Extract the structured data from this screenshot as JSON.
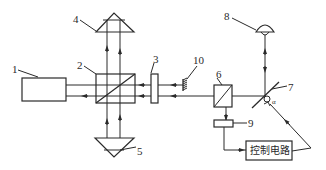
{
  "diagram": {
    "type": "optical-interferometer-schematic",
    "components": [
      {
        "id": "1",
        "label": "1",
        "shape": "rectangle"
      },
      {
        "id": "2",
        "label": "2",
        "shape": "beam-splitter-cube"
      },
      {
        "id": "3",
        "label": "3",
        "shape": "plate"
      },
      {
        "id": "4",
        "label": "4",
        "shape": "prism-top"
      },
      {
        "id": "5",
        "label": "5",
        "shape": "prism-bottom"
      },
      {
        "id": "6",
        "label": "6",
        "shape": "beam-splitter-cube"
      },
      {
        "id": "7",
        "label": "7",
        "shape": "tilted-mirror"
      },
      {
        "id": "8",
        "label": "8",
        "shape": "lamp-dome"
      },
      {
        "id": "9",
        "label": "9",
        "shape": "detector-bar"
      },
      {
        "id": "10",
        "label": "10",
        "shape": "hatched-reflector"
      }
    ],
    "control_box": {
      "label": "控制电路"
    },
    "angle_mark": "α",
    "colors": {
      "stroke": "#2a2a2a",
      "background": "#ffffff"
    }
  }
}
